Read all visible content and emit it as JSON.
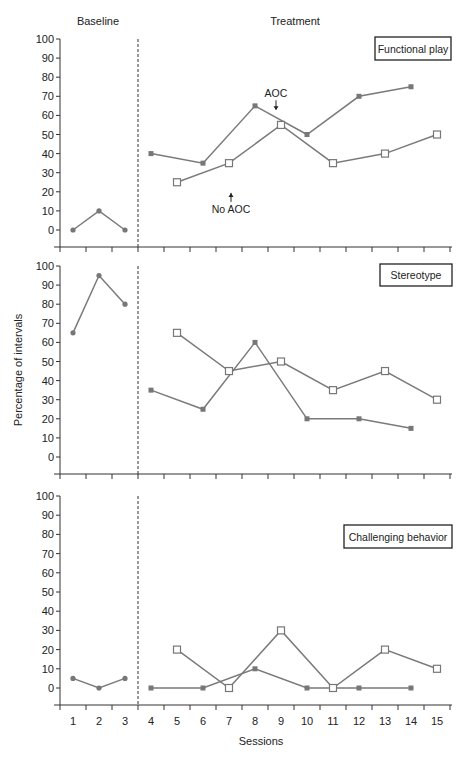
{
  "chart_data": {
    "type": "line",
    "title": "",
    "phase_labels": [
      "Baseline",
      "Treatment"
    ],
    "xlabel": "Sessions",
    "ylabel": "Percentage of intervals",
    "x": [
      1,
      2,
      3,
      4,
      5,
      6,
      7,
      8,
      9,
      10,
      11,
      12,
      13,
      14,
      15
    ],
    "ylim": [
      0,
      100
    ],
    "yticks": [
      0,
      10,
      20,
      30,
      40,
      50,
      60,
      70,
      80,
      90,
      100
    ],
    "phase_change_after_session": 3,
    "annotations": [
      {
        "panel": "Functional play",
        "text": "AOC",
        "arrow": "down",
        "session": 9
      },
      {
        "panel": "Functional play",
        "text": "No AOC",
        "arrow": "up",
        "session": 7
      }
    ],
    "panels": [
      {
        "name": "Functional play",
        "series": [
          {
            "name": "Baseline",
            "marker": "circle",
            "sessions": [
              1,
              2,
              3
            ],
            "values": [
              0,
              10,
              0
            ]
          },
          {
            "name": "AOC",
            "marker": "filled-square",
            "sessions": [
              4,
              6,
              8,
              10,
              12,
              14
            ],
            "values": [
              40,
              35,
              65,
              50,
              70,
              75
            ]
          },
          {
            "name": "No AOC",
            "marker": "open-square",
            "sessions": [
              5,
              7,
              9,
              11,
              13,
              15
            ],
            "values": [
              25,
              35,
              55,
              35,
              40,
              50
            ]
          }
        ]
      },
      {
        "name": "Stereotype",
        "series": [
          {
            "name": "Baseline",
            "marker": "circle",
            "sessions": [
              1,
              2,
              3
            ],
            "values": [
              65,
              95,
              80
            ]
          },
          {
            "name": "AOC",
            "marker": "filled-square",
            "sessions": [
              4,
              6,
              8,
              10,
              12,
              14
            ],
            "values": [
              35,
              25,
              60,
              20,
              20,
              15
            ]
          },
          {
            "name": "No AOC",
            "marker": "open-square",
            "sessions": [
              5,
              7,
              9,
              11,
              13,
              15
            ],
            "values": [
              65,
              45,
              50,
              35,
              45,
              30
            ]
          }
        ]
      },
      {
        "name": "Challenging behavior",
        "series": [
          {
            "name": "Baseline",
            "marker": "circle",
            "sessions": [
              1,
              2,
              3
            ],
            "values": [
              5,
              0,
              5
            ]
          },
          {
            "name": "AOC",
            "marker": "filled-square",
            "sessions": [
              4,
              6,
              8,
              10,
              12,
              14
            ],
            "values": [
              0,
              0,
              10,
              0,
              0,
              0
            ]
          },
          {
            "name": "No AOC",
            "marker": "open-square",
            "sessions": [
              5,
              7,
              9,
              11,
              13,
              15
            ],
            "values": [
              20,
              0,
              30,
              0,
              20,
              10
            ]
          }
        ]
      }
    ],
    "grid": false,
    "legend_position": "top-right boxed panel label"
  },
  "colors": {
    "line": "#7a7a7a",
    "marker": "#777777",
    "axis": "#333333",
    "text": "#222222"
  }
}
